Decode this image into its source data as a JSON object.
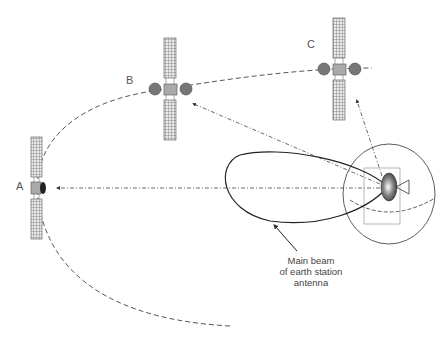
{
  "diagram": {
    "satellites": [
      {
        "id": "A",
        "label": "A"
      },
      {
        "id": "B",
        "label": "B"
      },
      {
        "id": "C",
        "label": "C"
      }
    ],
    "annotation": {
      "lines": [
        "Main beam",
        "of earth station",
        "antenna"
      ]
    },
    "colors": {
      "line": "#333333",
      "panel": "#777777",
      "body": "#aaaaaa",
      "dish": "#666666"
    }
  }
}
